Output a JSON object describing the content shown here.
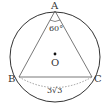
{
  "diagram": {
    "points": {
      "A": {
        "label": "A",
        "x": 55,
        "y": 11
      },
      "B": {
        "label": "B",
        "x": 19,
        "y": 77
      },
      "C": {
        "label": "C",
        "x": 92,
        "y": 77
      },
      "O": {
        "label": "O",
        "x": 55,
        "y": 54
      }
    },
    "circle": {
      "cx": 55,
      "cy": 57,
      "r": 45
    },
    "angle_A_label": "60°",
    "side_BC_label": "3√3",
    "colors": {
      "stroke": "#333333",
      "background": "#ffffff"
    }
  }
}
